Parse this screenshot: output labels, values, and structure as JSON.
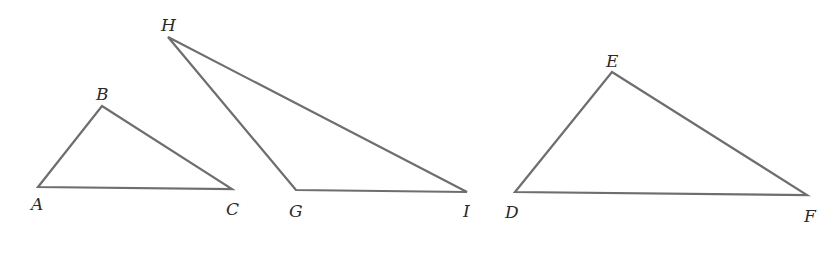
{
  "diagram": {
    "type": "geometry-triangles",
    "stroke_color": "#6e6e6e",
    "label_color": "#2a2a2a",
    "background": "#ffffff",
    "triangles": [
      {
        "name": "ABC",
        "vertices": [
          {
            "label": "A",
            "x": 38,
            "y": 187,
            "lx": 31,
            "ly": 210
          },
          {
            "label": "B",
            "x": 102,
            "y": 106,
            "lx": 96,
            "ly": 100
          },
          {
            "label": "C",
            "x": 232,
            "y": 189,
            "lx": 226,
            "ly": 215
          }
        ]
      },
      {
        "name": "GHI",
        "vertices": [
          {
            "label": "G",
            "x": 296,
            "y": 190,
            "lx": 289,
            "ly": 217
          },
          {
            "label": "H",
            "x": 168,
            "y": 37,
            "lx": 161,
            "ly": 31
          },
          {
            "label": "I",
            "x": 467,
            "y": 192,
            "lx": 463,
            "ly": 217
          }
        ]
      },
      {
        "name": "DEF",
        "vertices": [
          {
            "label": "D",
            "x": 515,
            "y": 192,
            "lx": 505,
            "ly": 218
          },
          {
            "label": "E",
            "x": 612,
            "y": 72,
            "lx": 606,
            "ly": 67
          },
          {
            "label": "F",
            "x": 807,
            "y": 195,
            "lx": 804,
            "ly": 222
          }
        ]
      }
    ]
  }
}
